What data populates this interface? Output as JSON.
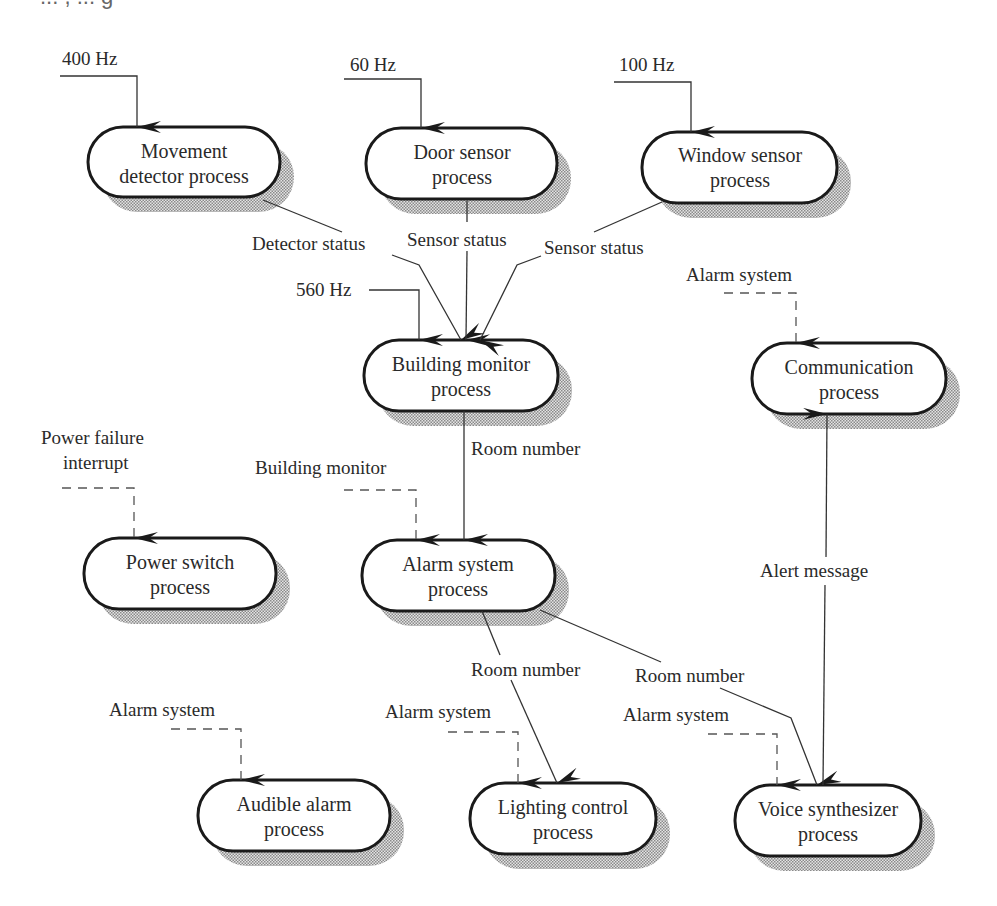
{
  "header": {
    "clipped_caption": "...  ,  ...  g"
  },
  "colors": {
    "line": "#333333",
    "node_border": "#1a1a1a",
    "shadow": "#9a9a9a",
    "background": "#ffffff"
  },
  "nodes": [
    {
      "id": "movement",
      "line1": "Movement",
      "line2": "detector process"
    },
    {
      "id": "door",
      "line1": "Door sensor",
      "line2": "process"
    },
    {
      "id": "window",
      "line1": "Window sensor",
      "line2": "process"
    },
    {
      "id": "building",
      "line1": "Building monitor",
      "line2": "process"
    },
    {
      "id": "communication",
      "line1": "Communication",
      "line2": "process"
    },
    {
      "id": "power",
      "line1": "Power switch",
      "line2": "process"
    },
    {
      "id": "alarm",
      "line1": "Alarm system",
      "line2": "process"
    },
    {
      "id": "audible",
      "line1": "Audible alarm",
      "line2": "process"
    },
    {
      "id": "lighting",
      "line1": "Lighting control",
      "line2": "process"
    },
    {
      "id": "voice",
      "line1": "Voice synthesizer",
      "line2": "process"
    }
  ],
  "stimuli": {
    "movement_freq": "400 Hz",
    "door_freq": "60 Hz",
    "window_freq": "100 Hz",
    "building_freq": "560 Hz",
    "communication_trigger": "Alarm system",
    "power_trigger_line1": "Power failure",
    "power_trigger_line2": "interrupt",
    "alarm_trigger": "Building monitor",
    "audible_trigger": "Alarm system",
    "lighting_trigger": "Alarm system",
    "voice_trigger": "Alarm system"
  },
  "flows": {
    "detector_status": "Detector status",
    "door_sensor_status": "Sensor status",
    "window_sensor_status": "Sensor status",
    "building_to_alarm": "Room number",
    "alarm_to_lighting": "Room number",
    "alarm_to_voice": "Room number",
    "voice_to_communication": "Alert message"
  }
}
